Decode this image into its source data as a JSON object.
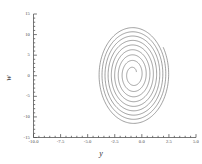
{
  "figure": {
    "background": "#ffffff",
    "line_color": "#6e6e6e",
    "axis_color": "#555555"
  },
  "chart_data": {
    "type": "line",
    "title": "",
    "xlabel": "y",
    "ylabel": "w",
    "xlim": [
      -10.0,
      5.0
    ],
    "ylim": [
      -15,
      15
    ],
    "grid": false,
    "legend": null,
    "xticks": [
      -10.0,
      -7.5,
      -5.0,
      -2.5,
      0.0,
      2.5,
      5.0
    ],
    "xticklabels": [
      "-10.0",
      "-7.5",
      "-5.0",
      "-2.5",
      "0.0",
      "2.5",
      "5.0"
    ],
    "yticks": [
      -15,
      -10,
      -5,
      0,
      5,
      10,
      15
    ],
    "yticklabels": [
      "-15",
      "-10",
      "-5",
      "0",
      "5",
      "10",
      "15"
    ],
    "minor_ticks_per_interval": 5,
    "series": [
      {
        "name": "trajectory",
        "description": "inward spiral converging to a focus",
        "center": [
          -0.8,
          0.3
        ],
        "start_point": [
          2.3,
          12.6
        ],
        "end_point": [
          -0.6,
          0.2
        ],
        "turns": 9,
        "outer_radius_x": 3.3,
        "outer_radius_y": 12.2,
        "inner_radius_x": 0.35,
        "inner_radius_y": 1.3,
        "decay": 0.8
      }
    ]
  }
}
